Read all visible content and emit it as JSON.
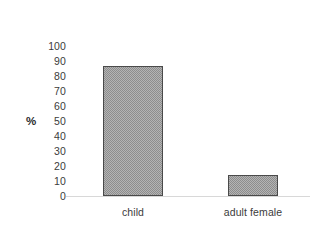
{
  "chart_data": {
    "type": "bar",
    "title": "",
    "xlabel": "",
    "ylabel": "%",
    "categories": [
      "child",
      "adult female"
    ],
    "values": [
      87,
      14
    ],
    "ylim": [
      0,
      100
    ],
    "yticks": [
      100,
      90,
      80,
      70,
      60,
      50,
      40,
      30,
      20,
      10,
      0
    ],
    "ytick_labels": [
      "100",
      "90",
      "80",
      "70",
      "60",
      "50",
      "40",
      "30",
      "20",
      "10",
      "0"
    ],
    "grid": false,
    "legend": false,
    "legend_position": "none",
    "series": [
      {
        "name": "percentage",
        "values": [
          87,
          14
        ]
      }
    ],
    "bar_fill": "#b4b4b4",
    "bar_pattern": "checkerboard-dither",
    "bar_border_color": "#4a4a4a",
    "baseline_color": "#d8d8d8",
    "background": "#ffffff",
    "text_color": "#3b3b3b"
  },
  "axis": {
    "y_title": "%",
    "ticks": [
      {
        "label": "100",
        "value": 100
      },
      {
        "label": "90",
        "value": 90
      },
      {
        "label": "80",
        "value": 80
      },
      {
        "label": "70",
        "value": 70
      },
      {
        "label": "60",
        "value": 60
      },
      {
        "label": "50",
        "value": 50
      },
      {
        "label": "40",
        "value": 40
      },
      {
        "label": "30",
        "value": 30
      },
      {
        "label": "20",
        "value": 20
      },
      {
        "label": "10",
        "value": 10
      },
      {
        "label": "0",
        "value": 0
      }
    ]
  },
  "bars": [
    {
      "label": "child",
      "value": 87
    },
    {
      "label": "adult female",
      "value": 14
    }
  ]
}
